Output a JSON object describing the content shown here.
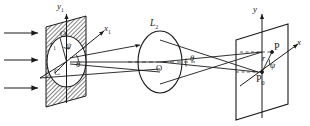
{
  "figure": {
    "kind": "optical-ray-diagram",
    "width": 310,
    "height": 126,
    "background": "#ffffff",
    "ink": "#1a1a1a",
    "hatch_color": "#585858"
  },
  "labels": {
    "y1_axis": "y",
    "y1_axis_sub": "1",
    "x1_axis": "x",
    "x1_axis_sub": "1",
    "aperture_radius": "r",
    "aperture_radius_sub": "1",
    "aperture_center_O": "O",
    "aperture_center_C": "C",
    "psi_aperture": "ψ",
    "theta_aperture": "θ",
    "lens_name": "L",
    "lens_name_sub": "2",
    "lens_center": "O",
    "theta_lens": "θ",
    "image_y_axis": "y",
    "image_x_axis": "x",
    "point_P": "P",
    "point_P0": "P",
    "point_P0_sub": "0",
    "image_radius": "r",
    "psi_image": "ψ"
  },
  "elements": {
    "incident_rays_count": 3,
    "aperture_plane": "hatched parallelogram with inscribed white circle",
    "lens": "ellipse outline",
    "image_plane": "open parallelogram"
  }
}
